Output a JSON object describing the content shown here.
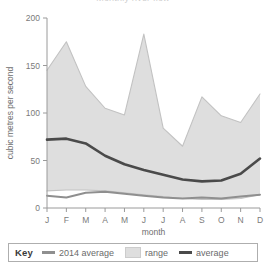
{
  "chart_data": {
    "type": "area",
    "title": "Monthly river flow",
    "xlabel": "month",
    "ylabel": "cubic metres per second",
    "categories": [
      "J",
      "F",
      "M",
      "A",
      "M",
      "J",
      "J",
      "A",
      "S",
      "O",
      "N",
      "D"
    ],
    "category_names": [
      "January",
      "February",
      "March",
      "April",
      "May",
      "June",
      "July",
      "August",
      "September",
      "October",
      "November",
      "December"
    ],
    "ylim": [
      0,
      200
    ],
    "yticks": [
      0,
      50,
      100,
      150,
      200
    ],
    "ytick_labels": [
      "0",
      "50",
      "100",
      "150",
      "200"
    ],
    "grid": false,
    "legend_position": "below-plot",
    "series": [
      {
        "name": "range",
        "type": "band",
        "upper": [
          145,
          175,
          128,
          105,
          98,
          183,
          84,
          65,
          117,
          97,
          90,
          120
        ],
        "lower": [
          18,
          19,
          19,
          18,
          16,
          14,
          12,
          10,
          9,
          9,
          10,
          14
        ]
      },
      {
        "name": "average",
        "type": "line",
        "values": [
          72,
          73,
          68,
          55,
          46,
          40,
          35,
          30,
          28,
          29,
          36,
          52
        ]
      },
      {
        "name": "2014 average",
        "type": "line",
        "values": [
          13,
          11,
          16,
          17,
          15,
          13,
          11,
          10,
          11,
          10,
          12,
          14
        ]
      }
    ]
  },
  "legend": {
    "key_label": "Key",
    "items": [
      {
        "label": "2014 average",
        "swatch": "line",
        "color": "#8f8f8f"
      },
      {
        "label": "range",
        "swatch": "area",
        "color": "#dedede"
      },
      {
        "label": "average",
        "swatch": "line",
        "color": "#4a4a4a"
      }
    ]
  }
}
